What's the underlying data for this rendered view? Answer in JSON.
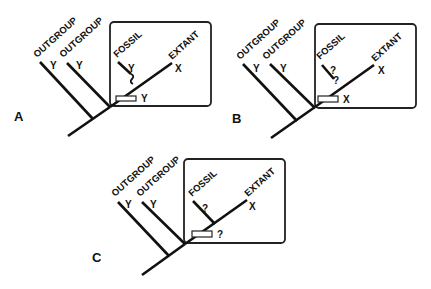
{
  "figure": {
    "panels": [
      {
        "id": "A",
        "label": "A",
        "outgroup_labels": [
          "OUTGROUP",
          "OUTGROUP"
        ],
        "outgroup_states": [
          "Y",
          "Y"
        ],
        "fossil_label": "FOSSIL",
        "fossil_state": "Y",
        "fossil_uncertain": "?",
        "extant_label": "EXTANT",
        "extant_state": "X",
        "node_state": "Y"
      },
      {
        "id": "B",
        "label": "B",
        "outgroup_labels": [
          "OUTGROUP",
          "OUTGROUP"
        ],
        "outgroup_states": [
          "Y",
          "Y"
        ],
        "fossil_label": "FOSSIL",
        "fossil_state": "?",
        "fossil_uncertain": "?",
        "extant_label": "EXTANT",
        "extant_state": "X",
        "node_state": "X"
      },
      {
        "id": "C",
        "label": "C",
        "outgroup_labels": [
          "OUTGROUP",
          "OUTGROUP"
        ],
        "outgroup_states": [
          "Y",
          "Y"
        ],
        "fossil_label": "FOSSIL",
        "fossil_state": "?",
        "extant_label": "EXTANT",
        "extant_state": "X",
        "node_state": "?"
      }
    ]
  }
}
